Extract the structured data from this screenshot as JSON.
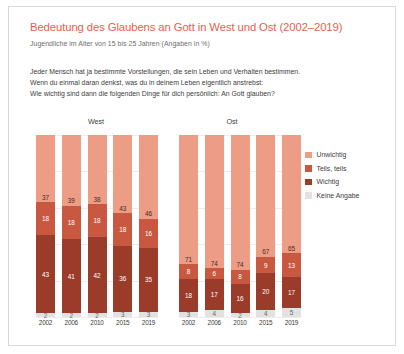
{
  "header": {
    "title": "Bedeutung des Glaubens an Gott in West und Ost (2002–2019)",
    "subtitle": "Jugendliche im Alter von 15 bis 25 Jahren (Angaben in %)",
    "question_line1": "Jeder Mensch hat ja bestimmte Vorstellungen, die sein Leben und Verhalten bestimmen.",
    "question_line2": "Wenn du einmal daran denkst, was du in deinem Leben eigentlich anstrebst:",
    "question_line3": "Wie wichtig sind dann die folgenden Dinge für dich persönlich: An Gott glauben?"
  },
  "groups": {
    "west_label": "West",
    "ost_label": "Ost"
  },
  "legend": {
    "position": "right",
    "items": [
      {
        "label": "Unwichtig",
        "color": "#ed9d85"
      },
      {
        "label": "Teils, teils",
        "color": "#c8583f"
      },
      {
        "label": "Wichtig",
        "color": "#9b3b29"
      },
      {
        "label": "Keine Angabe",
        "color": "#e2e2e2"
      }
    ]
  },
  "chart_data": {
    "type": "bar",
    "subtype": "stacked-100-percent",
    "title": "Bedeutung des Glaubens an Gott in West und Ost (2002–2019)",
    "subtitle": "Jugendliche im Alter von 15 bis 25 Jahren (Angaben in %)",
    "xlabel": "",
    "ylabel": "",
    "ylim": [
      0,
      100
    ],
    "grid": true,
    "legend_position": "right",
    "categories": [
      "2002",
      "2006",
      "2010",
      "2015",
      "2019"
    ],
    "panels": [
      {
        "name": "West",
        "series": [
          {
            "name": "Unwichtig",
            "color": "#ed9d85",
            "values": [
              37,
              39,
              38,
              43,
              46
            ]
          },
          {
            "name": "Teils, teils",
            "color": "#c8583f",
            "values": [
              18,
              18,
              18,
              18,
              16
            ]
          },
          {
            "name": "Wichtig",
            "color": "#9b3b29",
            "values": [
              43,
              41,
              42,
              36,
              35
            ]
          },
          {
            "name": "Keine Angabe",
            "color": "#e2e2e2",
            "values": [
              2,
              2,
              2,
              3,
              3
            ]
          }
        ]
      },
      {
        "name": "Ost",
        "series": [
          {
            "name": "Unwichtig",
            "color": "#ed9d85",
            "values": [
              71,
              74,
              74,
              67,
              65
            ]
          },
          {
            "name": "Teils, teils",
            "color": "#c8583f",
            "values": [
              8,
              6,
              8,
              9,
              13
            ]
          },
          {
            "name": "Wichtig",
            "color": "#9b3b29",
            "values": [
              18,
              17,
              16,
              20,
              17
            ]
          },
          {
            "name": "Keine Angabe",
            "color": "#e2e2e2",
            "values": [
              3,
              4,
              2,
              4,
              5
            ]
          }
        ]
      }
    ]
  }
}
